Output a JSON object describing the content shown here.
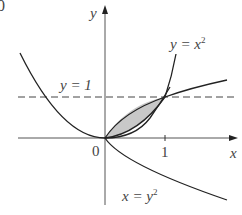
{
  "figure": {
    "corner_fragment": "0",
    "axes": {
      "x_label": "x",
      "y_label": "y",
      "origin_label": "0",
      "x_tick_label": "1"
    },
    "curves": [
      {
        "name": "parabola",
        "equation_lhs": "y = x",
        "exponent": "2"
      },
      {
        "name": "sideways-parabola",
        "equation_lhs": "x = y",
        "exponent": "2"
      }
    ],
    "reference_line": {
      "label": "y = 1",
      "style": "dashed"
    },
    "shaded_region": {
      "description": "region between y = x^2 and x = y^2 from (0,0) to (1,1)",
      "fill": "#c8c8c8"
    },
    "colors": {
      "stroke": "#222222",
      "axis": "#555555",
      "shade": "#c8c8c8",
      "text": "#444444"
    }
  }
}
